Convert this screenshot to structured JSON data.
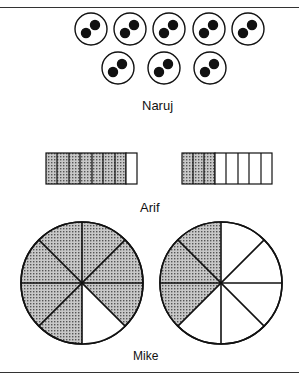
{
  "header": {
    "cut_off_title": "Fraction comparisons"
  },
  "colors": {
    "stroke": "#111111",
    "shade": "#a8a8a8",
    "background": "#ffffff"
  },
  "sections": [
    {
      "label": "Naruj",
      "kind": "counter-groups",
      "groups": 8,
      "dots_per_group": 2
    },
    {
      "label": "Arif",
      "kind": "bars",
      "bars": [
        {
          "segments": 8,
          "shaded": 7
        },
        {
          "segments": 8,
          "shaded": 3
        }
      ]
    },
    {
      "label": "Mike",
      "kind": "pies",
      "pies": [
        {
          "slices": 8,
          "shaded": 7
        },
        {
          "slices": 8,
          "shaded": 3
        }
      ]
    }
  ]
}
